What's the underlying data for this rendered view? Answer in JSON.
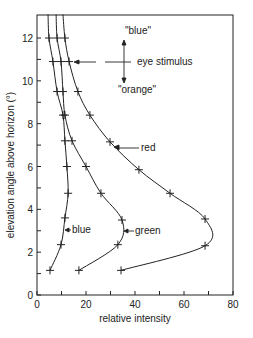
{
  "chart_data": {
    "type": "line",
    "title": "",
    "xlabel": "relative intensity",
    "ylabel": "elevation angle above horizon (°)",
    "xlim": [
      0,
      80
    ],
    "ylim": [
      0,
      13
    ],
    "x_ticks": [
      0,
      20,
      40,
      60,
      80
    ],
    "x_minor_ticks": [
      10,
      30,
      50,
      70
    ],
    "y_ticks": [
      0,
      2,
      4,
      6,
      8,
      10,
      12
    ],
    "y_minor_ticks": [
      1,
      3,
      5,
      7,
      9,
      11
    ],
    "grid": false,
    "legend": "inline labels",
    "series": [
      {
        "name": "blue",
        "points": [
          {
            "x": 5.3,
            "y": 1.15
          },
          {
            "x": 9.8,
            "y": 2.35
          },
          {
            "x": 11.4,
            "y": 3.6
          },
          {
            "x": 12.7,
            "y": 4.75
          },
          {
            "x": 12.2,
            "y": 6.0
          },
          {
            "x": 11.4,
            "y": 7.2
          },
          {
            "x": 10.6,
            "y": 8.4
          },
          {
            "x": 8.2,
            "y": 9.5
          },
          {
            "x": 6.5,
            "y": 10.9
          },
          {
            "x": 4.9,
            "y": 12.0
          },
          {
            "x": 4.5,
            "y": 13.1
          }
        ]
      },
      {
        "name": "green",
        "points": [
          {
            "x": 17.1,
            "y": 1.15
          },
          {
            "x": 33.0,
            "y": 2.35
          },
          {
            "x": 34.7,
            "y": 3.5
          },
          {
            "x": 26.1,
            "y": 4.75
          },
          {
            "x": 20.0,
            "y": 6.0
          },
          {
            "x": 14.3,
            "y": 7.2
          },
          {
            "x": 11.4,
            "y": 8.4
          },
          {
            "x": 10.6,
            "y": 9.5
          },
          {
            "x": 9.8,
            "y": 10.9
          },
          {
            "x": 8.2,
            "y": 12.0
          },
          {
            "x": 7.8,
            "y": 13.1
          }
        ]
      },
      {
        "name": "red",
        "points": [
          {
            "x": 34.3,
            "y": 1.15
          },
          {
            "x": 68.6,
            "y": 2.3
          },
          {
            "x": 68.6,
            "y": 3.55
          },
          {
            "x": 54.3,
            "y": 4.75
          },
          {
            "x": 41.6,
            "y": 5.85
          },
          {
            "x": 29.8,
            "y": 7.15
          },
          {
            "x": 21.6,
            "y": 8.4
          },
          {
            "x": 16.7,
            "y": 9.5
          },
          {
            "x": 13.1,
            "y": 10.9
          },
          {
            "x": 11.4,
            "y": 12.0
          },
          {
            "x": 10.6,
            "y": 13.1
          }
        ]
      }
    ],
    "annotations": [
      {
        "text": "\"blue\"",
        "role": "up-direction label"
      },
      {
        "text": "eye stimulus",
        "role": "crosshair label",
        "y": 10.9
      },
      {
        "text": "\"orange\"",
        "role": "down-direction label"
      },
      {
        "text": "red",
        "role": "curve label"
      },
      {
        "text": "green",
        "role": "curve label"
      },
      {
        "text": "blue",
        "role": "curve label"
      }
    ]
  },
  "labels": {
    "xlabel": "relative intensity",
    "ylabel": "elevation angle above horizon (°)",
    "blue_quote": "\"blue\"",
    "orange_quote": "\"orange\"",
    "eye_stimulus": "eye stimulus",
    "red": "red",
    "green": "green",
    "blue": "blue"
  },
  "colors": {
    "ink": "#222222",
    "background": "#ffffff"
  }
}
